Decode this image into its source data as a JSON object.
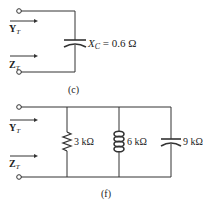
{
  "circuits": [
    {
      "id": "c",
      "caption": "(c)",
      "input_labels": {
        "admittance": "Y",
        "admittance_sub": "T",
        "impedance": "Z",
        "impedance_sub": "T"
      },
      "components": [
        {
          "type": "capacitor",
          "label_main": "X",
          "label_sub": "C",
          "label_value": " = 0.6 Ω"
        }
      ]
    },
    {
      "id": "f",
      "caption": "(f)",
      "input_labels": {
        "admittance": "Y",
        "admittance_sub": "T",
        "impedance": "Z",
        "impedance_sub": "T"
      },
      "components": [
        {
          "type": "resistor",
          "label": "3 kΩ"
        },
        {
          "type": "inductor",
          "label": "6 kΩ"
        },
        {
          "type": "capacitor",
          "label": "9 kΩ"
        }
      ]
    }
  ],
  "colors": {
    "wire": "#333333",
    "text": "#222222"
  }
}
